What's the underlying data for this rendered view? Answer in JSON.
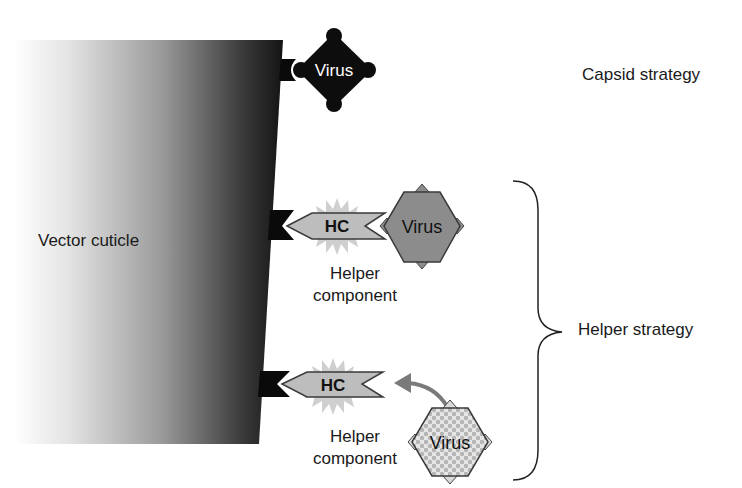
{
  "diagram": {
    "cuticle": {
      "label": "Vector cuticle"
    },
    "capsid_strategy": {
      "label": "Capsid strategy",
      "virus": {
        "label": "Virus",
        "shape": "diamond-with-knobs",
        "fill": "#0d0d0d"
      }
    },
    "helper_strategy": {
      "label": "Helper strategy",
      "rows": [
        {
          "hc": {
            "label": "HC",
            "fill": "#bdbdbd"
          },
          "caption_line1": "Helper",
          "caption_line2": "component",
          "virus": {
            "label": "Virus",
            "shape": "hexagon",
            "fill": "#8c8c8c",
            "state": "bound"
          }
        },
        {
          "hc": {
            "label": "HC",
            "fill": "#bdbdbd"
          },
          "caption_line1": "Helper",
          "caption_line2": "component",
          "virus": {
            "label": "Virus",
            "shape": "hexagon-dotted",
            "fill": "#d9d9d9",
            "state": "approaching"
          }
        }
      ]
    },
    "colors": {
      "receptor": "#0a0a0a",
      "starburst": "#c8c8c8",
      "arrow": "#7a7a7a"
    }
  }
}
